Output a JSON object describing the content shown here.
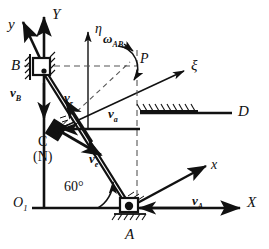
{
  "figure": {
    "background_color": "#ffffff",
    "stroke_color": "#111111",
    "dash_color": "#666666"
  },
  "axes": [
    {
      "id": "X",
      "label": "X",
      "kind": "fixed-axis",
      "x": 247,
      "y": 202,
      "direction": "right"
    },
    {
      "id": "Y",
      "label": "Y",
      "kind": "fixed-axis",
      "x": 52,
      "y": 14,
      "direction": "up"
    },
    {
      "id": "O1",
      "label": "O",
      "subscript": "1",
      "kind": "origin",
      "x": 18,
      "y": 198
    },
    {
      "id": "x",
      "label": "x",
      "kind": "moving-axis",
      "x": 213,
      "y": 165,
      "direction": "up-right"
    },
    {
      "id": "y",
      "label": "y",
      "kind": "moving-axis",
      "x": 10,
      "y": 24,
      "direction": "up-left"
    },
    {
      "id": "xi",
      "label": "ξ",
      "kind": "rotating-axis",
      "x": 195,
      "y": 60,
      "direction": "up-right"
    },
    {
      "id": "eta",
      "label": "η",
      "kind": "rotating-axis",
      "x": 94,
      "y": 27,
      "direction": "up"
    }
  ],
  "points": [
    {
      "id": "A",
      "label": "A",
      "x": 129,
      "y": 229,
      "note": "pin support on ground"
    },
    {
      "id": "B",
      "label": "B",
      "x": 14,
      "y": 66,
      "note": "slider block on Y guide"
    },
    {
      "id": "C",
      "label": "C",
      "x": 53,
      "y": 131,
      "note": "slider on rod AB"
    },
    {
      "id": "N",
      "label": "(N)",
      "x": 50,
      "y": 145,
      "note": "coincident point"
    },
    {
      "id": "P",
      "label": "P",
      "x": 142,
      "y": 58,
      "note": "point on rotating frame"
    },
    {
      "id": "D",
      "label": "D",
      "x": 240,
      "y": 110,
      "note": "end of fixed hatched guide"
    }
  ],
  "vectors": [
    {
      "id": "vB",
      "label": "v",
      "subscript": "B",
      "x": 14,
      "y": 92,
      "direction": "down",
      "note": "velocity of slider B along Y"
    },
    {
      "id": "vr",
      "label": "v",
      "subscript": "r",
      "x": 68,
      "y": 97,
      "direction": "up-left",
      "note": "relative velocity along rod"
    },
    {
      "id": "va",
      "label": "v",
      "subscript": "a",
      "x": 112,
      "y": 113,
      "direction": "left",
      "note": "absolute velocity of C"
    },
    {
      "id": "ve",
      "label": "v",
      "subscript": "e",
      "x": 92,
      "y": 157,
      "direction": "down-right",
      "note": "transport velocity"
    },
    {
      "id": "vA",
      "label": "v",
      "subscript": "A",
      "x": 196,
      "y": 201,
      "direction": "left",
      "note": "velocity at A"
    }
  ],
  "angles": [
    {
      "id": "angle60",
      "label": "60°",
      "x": 68,
      "y": 187,
      "between": [
        "X-axis",
        "rod AC"
      ]
    },
    {
      "id": "omegaAB",
      "label": "ω",
      "subscript": "AB",
      "x": 106,
      "y": 36,
      "note": "angular velocity of rod AB, counter-clockwise arc"
    }
  ],
  "supports": [
    {
      "id": "ground-A",
      "type": "hatched-ground",
      "note": "below pin A"
    },
    {
      "id": "guide-B",
      "type": "hatched-guide",
      "note": "vertical guide at B"
    },
    {
      "id": "guide-D",
      "type": "hatched-guide",
      "note": "horizontal hatched guide ending at D"
    }
  ]
}
